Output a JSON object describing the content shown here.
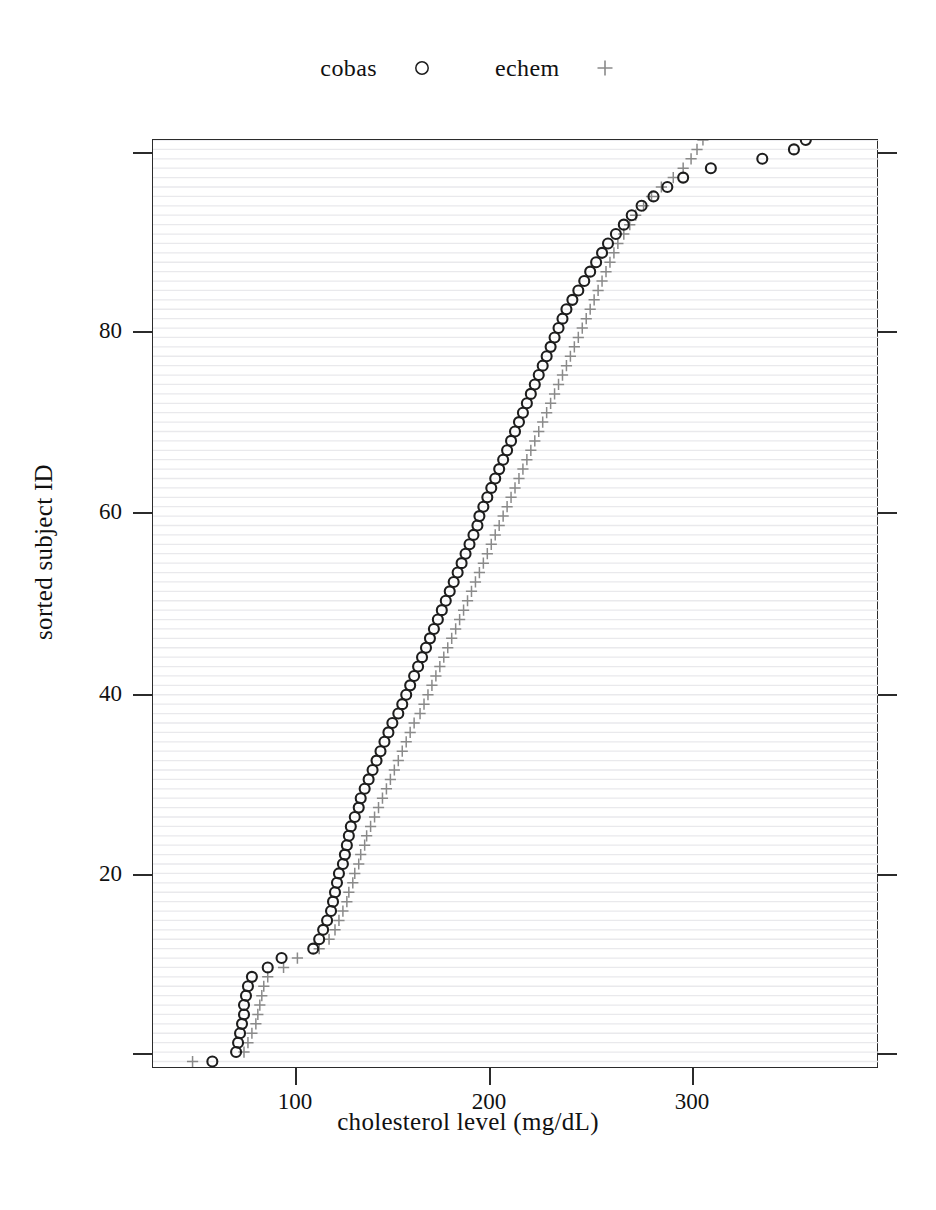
{
  "legend": {
    "entries": [
      {
        "label": "cobas",
        "marker": "circle-marker-icon",
        "color": "#1d1d1d"
      },
      {
        "label": "echem",
        "marker": "plus-marker-icon",
        "color": "#8a8a8a"
      }
    ]
  },
  "axes": {
    "xlabel": "cholesterol level (mg/dL)",
    "ylabel": "sorted subject ID",
    "xticks": [
      "100",
      "200",
      "300"
    ],
    "yticks": [
      "20",
      "40",
      "60",
      "80"
    ]
  },
  "chart_data": {
    "type": "scatter",
    "title": "",
    "xlabel": "cholesterol level (mg/dL)",
    "ylabel": "sorted subject ID",
    "xlim": [
      28,
      395
    ],
    "ylim": [
      0.2,
      99
    ],
    "xticks": [
      100,
      200,
      300
    ],
    "yticks": [
      20,
      40,
      60,
      80
    ],
    "grid": "horizontal-faint-one-per-subject",
    "legend_position": "top-center-outside",
    "marker_styles": {
      "cobas": {
        "shape": "open-circle",
        "color": "#1d1d1d",
        "size": 9
      },
      "echem": {
        "shape": "plus",
        "color": "#8a8a8a",
        "size": 9
      }
    },
    "series": [
      {
        "name": "cobas",
        "x": [
          58,
          70,
          71,
          72,
          73,
          74,
          74,
          75,
          76,
          78,
          86,
          93,
          109,
          112,
          114,
          116,
          118,
          119,
          120,
          121,
          122,
          124,
          125,
          126,
          127,
          128,
          130,
          132,
          133,
          135,
          137,
          139,
          141,
          143,
          145,
          147,
          149,
          152,
          154,
          156,
          158,
          160,
          162,
          164,
          166,
          168,
          170,
          172,
          174,
          176,
          178,
          180,
          182,
          184,
          186,
          188,
          190,
          192,
          193,
          195,
          197,
          199,
          201,
          203,
          205,
          207,
          209,
          211,
          213,
          215,
          217,
          219,
          221,
          223,
          225,
          227,
          229,
          231,
          233,
          235,
          237,
          240,
          243,
          246,
          249,
          252,
          255,
          258,
          262,
          266,
          270,
          275,
          281,
          288,
          296,
          310,
          336,
          352,
          358,
          362
        ],
        "y": [
          1,
          2,
          3,
          4,
          5,
          6,
          7,
          8,
          9,
          10,
          11,
          12,
          13,
          14,
          15,
          16,
          17,
          18,
          19,
          20,
          21,
          22,
          23,
          24,
          25,
          26,
          27,
          28,
          29,
          30,
          31,
          32,
          33,
          34,
          35,
          36,
          37,
          38,
          39,
          40,
          41,
          42,
          43,
          44,
          45,
          46,
          47,
          48,
          49,
          50,
          51,
          52,
          53,
          54,
          55,
          56,
          57,
          58,
          59,
          60,
          61,
          62,
          63,
          64,
          65,
          66,
          67,
          68,
          69,
          70,
          71,
          72,
          73,
          74,
          75,
          76,
          77,
          78,
          79,
          80,
          81,
          82,
          83,
          84,
          85,
          86,
          87,
          88,
          89,
          90,
          91,
          92,
          93,
          94,
          95,
          96,
          97,
          98,
          99,
          100
        ]
      },
      {
        "name": "echem",
        "x": [
          48,
          74,
          76,
          78,
          80,
          81,
          82,
          83,
          84,
          86,
          94,
          101,
          112,
          117,
          120,
          122,
          124,
          126,
          127,
          129,
          130,
          132,
          133,
          135,
          136,
          138,
          140,
          142,
          144,
          146,
          148,
          150,
          152,
          154,
          156,
          158,
          160,
          163,
          165,
          167,
          169,
          171,
          173,
          175,
          177,
          179,
          181,
          183,
          185,
          187,
          189,
          191,
          193,
          195,
          197,
          199,
          201,
          203,
          205,
          207,
          209,
          211,
          213,
          215,
          217,
          219,
          221,
          223,
          225,
          227,
          229,
          231,
          233,
          235,
          237,
          239,
          241,
          243,
          245,
          247,
          249,
          251,
          253,
          255,
          257,
          259,
          261,
          263,
          266,
          269,
          272,
          276,
          280,
          285,
          291,
          296,
          300,
          303,
          306,
          308
        ],
        "y": [
          1,
          2,
          3,
          4,
          5,
          6,
          7,
          8,
          9,
          10,
          11,
          12,
          13,
          14,
          15,
          16,
          17,
          18,
          19,
          20,
          21,
          22,
          23,
          24,
          25,
          26,
          27,
          28,
          29,
          30,
          31,
          32,
          33,
          34,
          35,
          36,
          37,
          38,
          39,
          40,
          41,
          42,
          43,
          44,
          45,
          46,
          47,
          48,
          49,
          50,
          51,
          52,
          53,
          54,
          55,
          56,
          57,
          58,
          59,
          60,
          61,
          62,
          63,
          64,
          65,
          66,
          67,
          68,
          69,
          70,
          71,
          72,
          73,
          74,
          75,
          76,
          77,
          78,
          79,
          80,
          81,
          82,
          83,
          84,
          85,
          86,
          87,
          88,
          89,
          90,
          91,
          92,
          93,
          94,
          95,
          96,
          97,
          98,
          99,
          100
        ]
      }
    ]
  }
}
